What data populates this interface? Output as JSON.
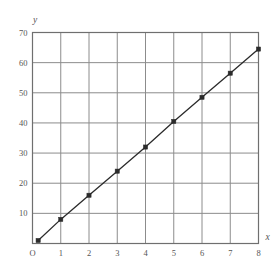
{
  "chart_data": {
    "type": "line",
    "title": "",
    "xlabel": "x",
    "ylabel": "y",
    "origin_label": "O",
    "x": [
      0.2,
      1,
      2,
      3,
      4,
      5,
      6,
      7,
      8
    ],
    "values": [
      1,
      8,
      16,
      24,
      32,
      40.5,
      48.5,
      56.5,
      64.5
    ],
    "series": [
      {
        "name": "",
        "x": [
          0.2,
          1,
          2,
          3,
          4,
          5,
          6,
          7,
          8
        ],
        "values": [
          1,
          8,
          16,
          24,
          32,
          40.5,
          48.5,
          56.5,
          64.5
        ]
      }
    ],
    "xlim": [
      0,
      8
    ],
    "ylim": [
      0,
      70
    ],
    "xticks": [
      0,
      1,
      2,
      3,
      4,
      5,
      6,
      7,
      8
    ],
    "xtick_labels": [
      "O",
      "1",
      "2",
      "3",
      "4",
      "5",
      "6",
      "7",
      "8"
    ],
    "yticks": [
      10,
      20,
      30,
      40,
      50,
      60,
      70
    ],
    "ytick_labels": [
      "10",
      "20",
      "30",
      "40",
      "50",
      "60",
      "70"
    ],
    "grid": true,
    "legend": null,
    "marker": "filled-square",
    "line_color": "#2b2b2b",
    "grid_color": "#8c8c8c",
    "axis_color": "#6f6f6f",
    "tick_text_color": "#555555",
    "background_color": "#ffffff"
  }
}
